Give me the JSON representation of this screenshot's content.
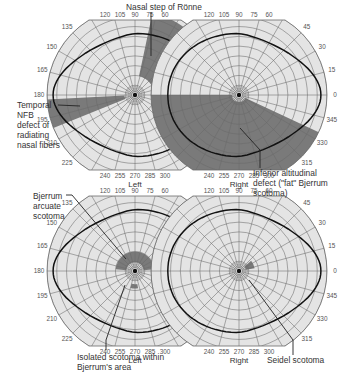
{
  "figure": {
    "panels": [
      {
        "id": "top-left",
        "eye": "Left",
        "cx": 135,
        "cy": 95,
        "defects": [
          {
            "type": "nasal-step",
            "description": "Nasal step of Rönne",
            "from_deg": 0,
            "to_deg": 78,
            "r_in": 0.22,
            "r_out": 0.95
          },
          {
            "type": "temporal-wedge",
            "description": "Temporal NFB defect of radiating nasal fibers",
            "from_deg": 183,
            "to_deg": 202,
            "r_in": 0.12,
            "r_out": 1.0
          }
        ]
      },
      {
        "id": "top-right",
        "eye": "Right",
        "cx": 239,
        "cy": 95,
        "defects": [
          {
            "type": "inferior-altitudinal",
            "description": "Inferior altitudinal defect (\"fat\" Bjerrum scotoma)",
            "from_deg": 180,
            "to_deg": 335,
            "r_in": 0.08,
            "r_out": 1.0
          }
        ]
      },
      {
        "id": "bottom-left",
        "eye": "Left",
        "cx": 135,
        "cy": 271,
        "defects": [
          {
            "type": "bjerrum-arcuate",
            "description": "Bjerrum arcuate scotoma",
            "from_deg": 5,
            "to_deg": 175,
            "r_in": 0.1,
            "r_out": 0.22
          },
          {
            "type": "isolated-scotoma",
            "description": "Isolated scotoma within Bjerrum's area",
            "from_deg": 255,
            "to_deg": 280,
            "r_in": 0.15,
            "r_out": 0.2
          }
        ]
      },
      {
        "id": "bottom-right",
        "eye": "Right",
        "cx": 239,
        "cy": 271,
        "defects": [
          {
            "type": "seidel-scotoma",
            "description": "Seidel scotoma",
            "from_deg": 10,
            "to_deg": 40,
            "r_in": 0.08,
            "r_out": 0.18
          }
        ]
      }
    ],
    "left_tick_labels": {
      "top": [
        "120",
        "105",
        "90",
        "75",
        "60"
      ],
      "side": [
        "135",
        "150",
        "165",
        "180",
        "195",
        "210",
        "225"
      ],
      "bottom": [
        "240",
        "255",
        "270",
        "285",
        "300"
      ]
    },
    "right_tick_labels": {
      "top": [
        "120",
        "105",
        "90",
        "75",
        "60"
      ],
      "side": [
        "45",
        "30",
        "15",
        "0",
        "345",
        "330",
        "315"
      ],
      "bottom": [
        "240",
        "255",
        "270",
        "285",
        "300"
      ]
    },
    "annotations": {
      "nasal_step": "Nasal step of Rönne",
      "temporal_1": "Temporal",
      "temporal_2": "NFB",
      "temporal_3": "defect of",
      "temporal_4": "radiating",
      "temporal_5": "nasal fibers",
      "inferior_1": "Inferior altitudinal",
      "inferior_2": "defect (\"fat\" Bjerrum",
      "inferior_3": "scotoma)",
      "bjerrum_1": "Bjerrum",
      "bjerrum_2": "arcuate",
      "bjerrum_3": "scotoma",
      "isolated_1": "Isolated scotoma within",
      "isolated_2": "Bjerrum's area",
      "seidel": "Seidel scotoma"
    },
    "colors": {
      "background": "#ffffff",
      "field": "#e4e4e4",
      "grid": "#6b6b6b",
      "defect": "#7a7a7a",
      "isopter": "#111111",
      "text": "#333333"
    }
  }
}
